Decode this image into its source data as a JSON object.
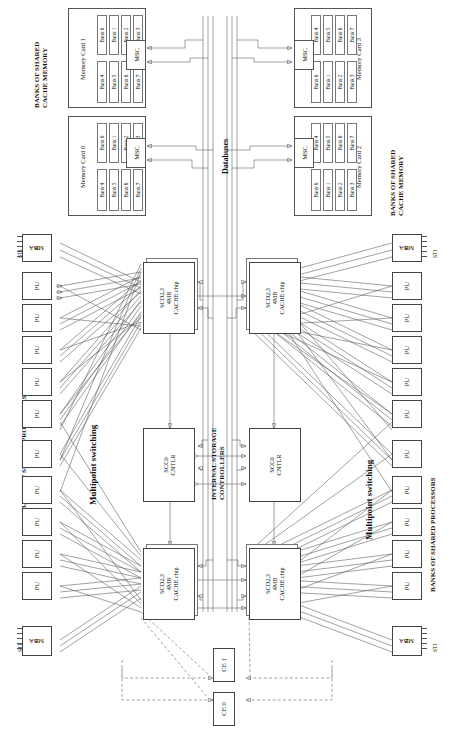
{
  "diagram": {
    "section_labels": {
      "memory_left": "BANKS OF SHARED\nCACHE MEMORY",
      "memory_left_line1": "BANKS OF SHARED",
      "memory_left_line2": "CACHE MEMORY",
      "memory_right_line1": "BANKS OF SHARED",
      "memory_right_line2": "CACHE MEMORY",
      "processors_left": "BANKS OF SHARED PROCESSORS",
      "processors_right": "BANKS OF SHARED PROCESSORS",
      "switching_left": "Multipoint switching",
      "switching_right": "Multipoint switching",
      "databuses": "Databuses",
      "storage_controllers_line1": "INTERNAL STORAGE",
      "storage_controllers_line2": "CONTROLLERS"
    },
    "memory_cards": [
      {
        "name": "Memory Card 0",
        "msc": "MSC",
        "banks_row_a": [
          "Bank 0",
          "Bank 1",
          "Bank 2",
          "Bank 3"
        ],
        "banks_row_b": [
          "Bank 4",
          "Bank 5",
          "Bank 6",
          "Bank 7"
        ]
      },
      {
        "name": "Memory Card 1",
        "msc": "MSC",
        "banks_row_a": [
          "Bank 0",
          "Bank 1",
          "Bank 2",
          "Bank 3"
        ],
        "banks_row_b": [
          "Bank 4",
          "Bank 5",
          "Bank 6",
          "Bank 7"
        ]
      },
      {
        "name": "Memory Card 2",
        "msc": "MSC",
        "banks_row_a": [
          "Bank 0",
          "Bank 1",
          "Bank 2",
          "Bank 3"
        ],
        "banks_row_b": [
          "Bank 4",
          "Bank 5",
          "Bank 6",
          "Bank 7"
        ]
      },
      {
        "name": "Memory Card 3",
        "msc": "MSC",
        "banks_row_a": [
          "Bank 0",
          "Bank 1",
          "Bank 2",
          "Bank 3"
        ],
        "banks_row_b": [
          "Bank 4",
          "Bank 5",
          "Bank 6",
          "Bank 7"
        ]
      }
    ],
    "cache_chips": [
      {
        "id": "top-left",
        "line1": "SCD2,3",
        "line2": "4MB",
        "line3": "CACHE chip"
      },
      {
        "id": "bottom-left",
        "line1": "SCD2,3",
        "line2": "4MB",
        "line3": "CACHE chip"
      },
      {
        "id": "top-right",
        "line1": "SCD2,3",
        "line2": "4MB",
        "line3": "CACHE chip"
      },
      {
        "id": "bottom-right",
        "line1": "SCD2,3",
        "line2": "4MB",
        "line3": "CACHE chip"
      }
    ],
    "controllers": [
      {
        "id": "left",
        "line1": "SCC0",
        "line2": "CNTLR"
      },
      {
        "id": "right",
        "line1": "SCC0",
        "line2": "CNTLR"
      }
    ],
    "channel_elements": [
      {
        "label": "CE 1"
      },
      {
        "label": "CE 0"
      }
    ],
    "mba_adapters": [
      {
        "label": "MBA",
        "number": "0",
        "sti": "STI",
        "side": "left-top"
      },
      {
        "label": "MBA",
        "number": "1",
        "sti": "STI",
        "side": "left-bottom"
      },
      {
        "label": "MBA",
        "number": "3",
        "sti": "STI",
        "side": "right-top"
      },
      {
        "label": "MBA",
        "number": "2",
        "sti": "STI",
        "side": "right-bottom"
      }
    ],
    "processing_units": {
      "label": "PU",
      "left_count": 10,
      "right_count": 10
    },
    "colors": {
      "line": "#555555",
      "box_border": "#444444",
      "background": "#ffffff",
      "text": "#111111"
    }
  }
}
